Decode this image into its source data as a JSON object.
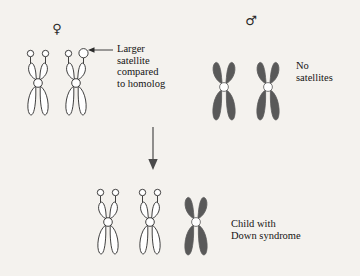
{
  "figure": {
    "background_color": "#f4f2ee",
    "outline_color": "#2b2b2b",
    "fill_light": "#ffffff",
    "fill_dark": "#595959"
  },
  "parents": {
    "female": {
      "symbol": "♀",
      "symbol_name": "venus-symbol",
      "chromosome_count": 2,
      "chromosome_style": "light",
      "has_satellites": true,
      "annotation": "Larger\nsatellite\ncompared\nto homolog",
      "annotation_lines": [
        "Larger",
        "satellite",
        "compared",
        "to homolog"
      ]
    },
    "male": {
      "symbol": "♂",
      "symbol_name": "mars-symbol",
      "chromosome_count": 2,
      "chromosome_style": "dark",
      "has_satellites": false,
      "annotation": "No\nsatellites",
      "annotation_lines": [
        "No",
        "satellites"
      ]
    }
  },
  "flow": {
    "arrow_direction": "down",
    "arrow_name": "inheritance-arrow"
  },
  "offspring": {
    "caption": "Child with\nDown syndrome",
    "caption_lines": [
      "Child with",
      "Down syndrome"
    ],
    "chromosome_count": 3,
    "chromosomes": [
      {
        "style": "light",
        "satellites": true
      },
      {
        "style": "light",
        "satellites": true
      },
      {
        "style": "dark",
        "satellites": false
      }
    ]
  }
}
